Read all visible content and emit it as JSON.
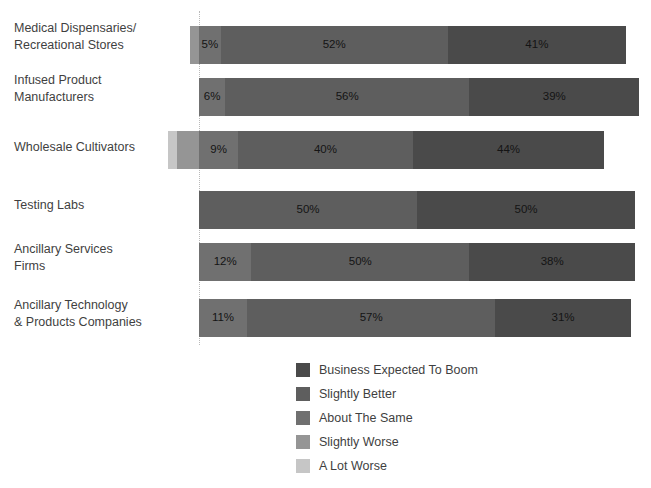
{
  "title": "",
  "axis": {
    "zero_line_label": "0%",
    "grid": false
  },
  "legend": {
    "position": "bottom-center",
    "items": [
      {
        "label": "Business Expected To Boom",
        "color": "#4a4a4a"
      },
      {
        "label": "Slightly Better",
        "color": "#5e5e5e"
      },
      {
        "label": "About The Same",
        "color": "#707070"
      },
      {
        "label": "Slightly Worse",
        "color": "#959595"
      },
      {
        "label": "A Lot Worse",
        "color": "#c6c6c6"
      }
    ]
  },
  "chart_data": {
    "type": "bar",
    "orientation": "horizontal",
    "stacked": true,
    "diverging": true,
    "title": "",
    "xlabel": "",
    "ylabel": "",
    "grid": false,
    "legend_position": "bottom-center",
    "categories": [
      "Medical Dispensaries/\nRecreational Stores",
      "Infused Product\nManufacturers",
      "Wholesale Cultivators",
      "Testing Labs",
      "Ancillary Services\nFirms",
      "Ancillary Technology\n& Products Companies"
    ],
    "series": [
      {
        "name": "Business Expected To Boom",
        "color": "#4a4a4a",
        "values": [
          41,
          39,
          44,
          50,
          38,
          31
        ]
      },
      {
        "name": "Slightly Better",
        "color": "#5e5e5e",
        "values": [
          52,
          56,
          40,
          50,
          50,
          57
        ]
      },
      {
        "name": "About The Same",
        "color": "#707070",
        "values": [
          5,
          6,
          9,
          0,
          12,
          11
        ]
      },
      {
        "name": "Slightly Worse",
        "color": "#959595",
        "values": [
          2,
          0,
          5,
          0,
          0,
          0
        ]
      },
      {
        "name": "A Lot Worse",
        "color": "#c6c6c6",
        "values": [
          0,
          0,
          2,
          0,
          0,
          0
        ]
      }
    ],
    "rows": [
      {
        "category": "Medical Dispensaries/\nRecreational Stores",
        "negative": [
          {
            "series": "Slightly Worse",
            "value": 2,
            "color": "#959595",
            "label": ""
          }
        ],
        "positive": [
          {
            "series": "About The Same",
            "value": 5,
            "color": "#707070",
            "label": "5%"
          },
          {
            "series": "Slightly Better",
            "value": 52,
            "color": "#5e5e5e",
            "label": "52%"
          },
          {
            "series": "Business Expected To Boom",
            "value": 41,
            "color": "#4a4a4a",
            "label": "41%"
          }
        ]
      },
      {
        "category": "Infused Product\nManufacturers",
        "negative": [],
        "positive": [
          {
            "series": "About The Same",
            "value": 6,
            "color": "#707070",
            "label": "6%"
          },
          {
            "series": "Slightly Better",
            "value": 56,
            "color": "#5e5e5e",
            "label": "56%"
          },
          {
            "series": "Business Expected To Boom",
            "value": 39,
            "color": "#4a4a4a",
            "label": "39%"
          }
        ]
      },
      {
        "category": "Wholesale Cultivators",
        "negative": [
          {
            "series": "A Lot Worse",
            "value": 2,
            "color": "#c6c6c6",
            "label": ""
          },
          {
            "series": "Slightly Worse",
            "value": 5,
            "color": "#959595",
            "label": ""
          }
        ],
        "positive": [
          {
            "series": "About The Same",
            "value": 9,
            "color": "#707070",
            "label": "9%"
          },
          {
            "series": "Slightly Better",
            "value": 40,
            "color": "#5e5e5e",
            "label": "40%"
          },
          {
            "series": "Business Expected To Boom",
            "value": 44,
            "color": "#4a4a4a",
            "label": "44%"
          }
        ]
      },
      {
        "category": "Testing Labs",
        "negative": [],
        "positive": [
          {
            "series": "Slightly Better",
            "value": 50,
            "color": "#5e5e5e",
            "label": "50%"
          },
          {
            "series": "Business Expected To Boom",
            "value": 50,
            "color": "#4a4a4a",
            "label": "50%"
          }
        ]
      },
      {
        "category": "Ancillary Services\nFirms",
        "negative": [],
        "positive": [
          {
            "series": "About The Same",
            "value": 12,
            "color": "#707070",
            "label": "12%"
          },
          {
            "series": "Slightly Better",
            "value": 50,
            "color": "#5e5e5e",
            "label": "50%"
          },
          {
            "series": "Business Expected To Boom",
            "value": 38,
            "color": "#4a4a4a",
            "label": "38%"
          }
        ]
      },
      {
        "category": "Ancillary Technology\n& Products Companies",
        "negative": [],
        "positive": [
          {
            "series": "About The Same",
            "value": 11,
            "color": "#707070",
            "label": "11%"
          },
          {
            "series": "Slightly Better",
            "value": 57,
            "color": "#5e5e5e",
            "label": "57%"
          },
          {
            "series": "Business Expected To Boom",
            "value": 31,
            "color": "#4a4a4a",
            "label": "31%"
          }
        ]
      }
    ]
  }
}
